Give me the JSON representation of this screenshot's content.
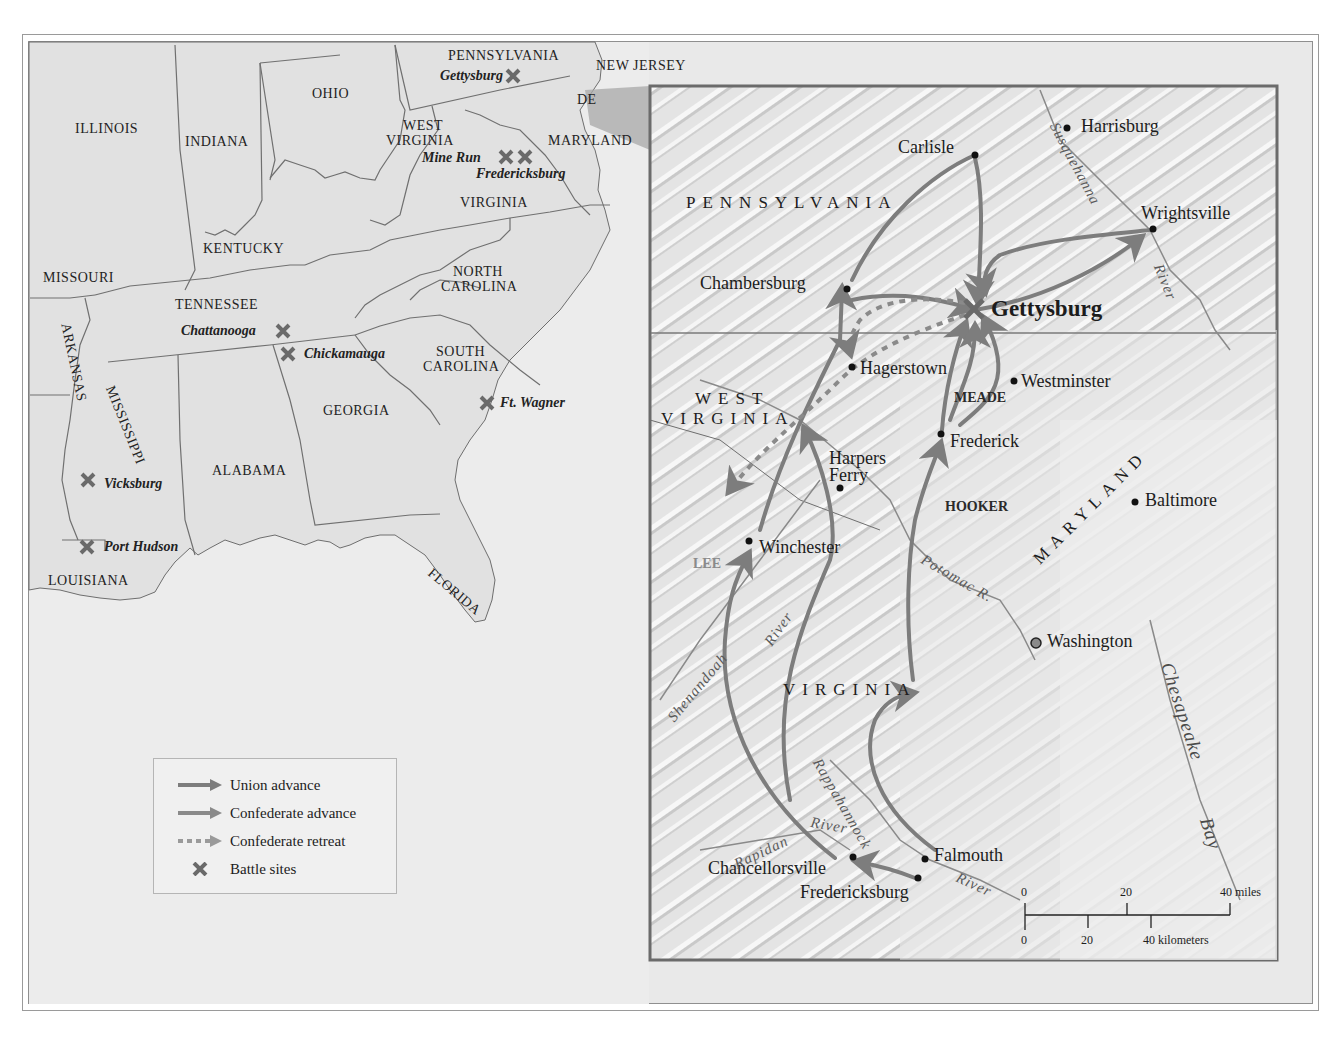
{
  "colors": {
    "land": "#e6e6e6",
    "water": "#efefef",
    "border": "#6e6e6e",
    "arrow": "#7d7d7d",
    "battle_x": "#6a6a6a",
    "inset_frame": "#6b6b6b"
  },
  "overview_map": {
    "states": [
      {
        "name": "Illinois",
        "label": "ILLINOIS"
      },
      {
        "name": "Indiana",
        "label": "INDIANA"
      },
      {
        "name": "Ohio",
        "label": "OHIO"
      },
      {
        "name": "Pennsylvania",
        "label": "PENNSYLVANIA"
      },
      {
        "name": "New Jersey",
        "label": "NEW JERSEY"
      },
      {
        "name": "Delaware",
        "label": "DE"
      },
      {
        "name": "Maryland",
        "label": "MARYLAND"
      },
      {
        "name": "West Virginia",
        "label": "WEST VIRGINIA"
      },
      {
        "name": "Virginia",
        "label": "VIRGINIA"
      },
      {
        "name": "Kentucky",
        "label": "KENTUCKY"
      },
      {
        "name": "Missouri",
        "label": "MISSOURI"
      },
      {
        "name": "Tennessee",
        "label": "TENNESSEE"
      },
      {
        "name": "North Carolina",
        "label": "NORTH CAROLINA"
      },
      {
        "name": "South Carolina",
        "label": "SOUTH CAROLINA"
      },
      {
        "name": "Arkansas",
        "label": "ARKANSAS"
      },
      {
        "name": "Mississippi",
        "label": "MISSISSIPPI"
      },
      {
        "name": "Alabama",
        "label": "ALABAMA"
      },
      {
        "name": "Georgia",
        "label": "GEORGIA"
      },
      {
        "name": "Louisiana",
        "label": "LOUISIANA"
      },
      {
        "name": "Florida",
        "label": "FLORIDA"
      }
    ],
    "labels": {
      "illinois": "ILLINOIS",
      "indiana": "INDIANA",
      "ohio": "OHIO",
      "pennsylvania": "PENNSYLVANIA",
      "new_jersey": "NEW JERSEY",
      "de": "DE",
      "maryland": "MARYLAND",
      "west": "WEST",
      "virginia_wv": "VIRGINIA",
      "virginia": "VIRGINIA",
      "kentucky": "KENTUCKY",
      "missouri": "MISSOURI",
      "tennessee": "TENNESSEE",
      "north": "NORTH",
      "carolina_n": "CAROLINA",
      "south": "SOUTH",
      "carolina_s": "CAROLINA",
      "arkansas": "ARKANSAS",
      "mississippi": "MISSISSIPPI",
      "alabama": "ALABAMA",
      "georgia": "GEORGIA",
      "louisiana": "LOUISIANA",
      "florida": "FLORIDA"
    },
    "battle_sites": {
      "gettysburg": "Gettysburg",
      "mine_run": "Mine Run",
      "fredericksburg": "Fredericksburg",
      "chattanooga": "Chattanooga",
      "chickamauga": "Chickamauga",
      "ft_wagner": "Ft. Wagner",
      "vicksburg": "Vicksburg",
      "port_hudson": "Port Hudson"
    }
  },
  "inset_map": {
    "regions": {
      "pennsylvania": "PENNSYLVANIA",
      "west": "WEST",
      "virginia_wv": "VIRGINIA",
      "maryland": "MARYLAND",
      "virginia": "VIRGINIA"
    },
    "cities": {
      "harrisburg": "Harrisburg",
      "carlisle": "Carlisle",
      "wrightsville": "Wrightsville",
      "chambersburg": "Chambersburg",
      "gettysburg": "Gettysburg",
      "hagerstown": "Hagerstown",
      "westminster": "Westminster",
      "frederick": "Frederick",
      "harpers": "Harpers",
      "ferry": "Ferry",
      "baltimore": "Baltimore",
      "winchester": "Winchester",
      "washington": "Washington",
      "falmouth": "Falmouth",
      "chancellorsville": "Chancellorsville",
      "fredericksburg": "Fredericksburg"
    },
    "generals": {
      "meade": "MEADE",
      "hooker": "HOOKER",
      "lee": "LEE"
    },
    "rivers": {
      "susquehanna": "Susquehanna",
      "river_susq": "River",
      "potomac": "Potomac R.",
      "shenandoah": "Shenandoah",
      "river_shen": "River",
      "rappahannock": "Rappahannock",
      "river_rapp": "River",
      "rapidan": "Rapidan",
      "river_rapidan": "River",
      "chesapeake": "Chesapeake",
      "bay": "Bay"
    },
    "scale_bar": {
      "miles_ticks": [
        "0",
        "20",
        "40 miles"
      ],
      "km_ticks": [
        "0",
        "20",
        "40 kilometers"
      ]
    }
  },
  "legend": {
    "items": [
      {
        "symbol": "solid-arrow",
        "label": "Union advance"
      },
      {
        "symbol": "solid-arrow",
        "label": "Confederate advance"
      },
      {
        "symbol": "dashed-arrow",
        "label": "Confederate retreat"
      },
      {
        "symbol": "x-mark",
        "label": "Battle sites"
      }
    ]
  }
}
